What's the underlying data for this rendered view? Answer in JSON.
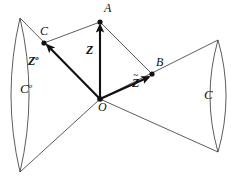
{
  "figure": {
    "background_color": "#ffffff",
    "stroke_color": "#3a3a3a",
    "bold_stroke_color": "#111111",
    "width": 237,
    "height": 178
  },
  "points": [
    {
      "id": "A",
      "label": "A",
      "x": 100,
      "y": 22,
      "label_x": 104,
      "label_y": 2,
      "dot": true
    },
    {
      "id": "B",
      "label": "B",
      "x": 152,
      "y": 74,
      "label_x": 156,
      "label_y": 56,
      "dot": true
    },
    {
      "id": "C",
      "label": "C",
      "x": 44,
      "y": 43,
      "label_x": 40,
      "label_y": 25,
      "dot": true
    },
    {
      "id": "O",
      "label": "O",
      "x": 100,
      "y": 99,
      "label_x": 98,
      "label_y": 101,
      "dot": true
    }
  ],
  "vectors": [
    {
      "id": "Z",
      "label": "Z",
      "superscript": "",
      "accent": "",
      "from": "O",
      "to": "A",
      "label_x": 86,
      "label_y": 44
    },
    {
      "id": "Zpolar",
      "label": "Z",
      "superscript": "o",
      "accent": "",
      "from": "O",
      "to": "C",
      "label_x": 28,
      "label_y": 55
    },
    {
      "id": "Ztilde",
      "label": "Z",
      "superscript": "",
      "accent": "~",
      "from": "O",
      "to": "B",
      "label_x": 132,
      "label_y": 77
    }
  ],
  "cones": [
    {
      "id": "polar-cone",
      "label": "C",
      "superscript": "o",
      "label_x": 20,
      "label_y": 82,
      "apex": {
        "x": 100,
        "y": 99
      },
      "edge_top": {
        "x": 20,
        "y": 18
      },
      "edge_bottom": {
        "x": 20,
        "y": 172
      },
      "cap_bulge": 16
    },
    {
      "id": "primal-cone",
      "label": "C",
      "superscript": "",
      "label_x": 204,
      "label_y": 88,
      "apex": {
        "x": 100,
        "y": 99
      },
      "edge_top": {
        "x": 218,
        "y": 40
      },
      "edge_bottom": {
        "x": 218,
        "y": 152
      },
      "cap_bulge": 14
    }
  ],
  "connectors": [
    {
      "id": "A-C",
      "from": "A",
      "to": "C"
    },
    {
      "id": "A-B",
      "from": "A",
      "to": "B"
    }
  ]
}
